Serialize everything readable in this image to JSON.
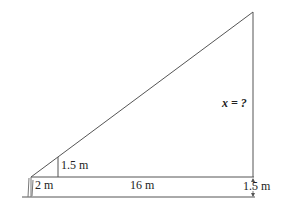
{
  "diagram": {
    "type": "similar-triangles",
    "labels": {
      "small_height": "1.5 m",
      "small_base": "2 m",
      "large_base_extra": "16 m",
      "eye_height": "1.5 m",
      "unknown": "x = ?"
    },
    "colors": {
      "line": "#555555",
      "text": "#222222",
      "background": "#ffffff"
    }
  }
}
